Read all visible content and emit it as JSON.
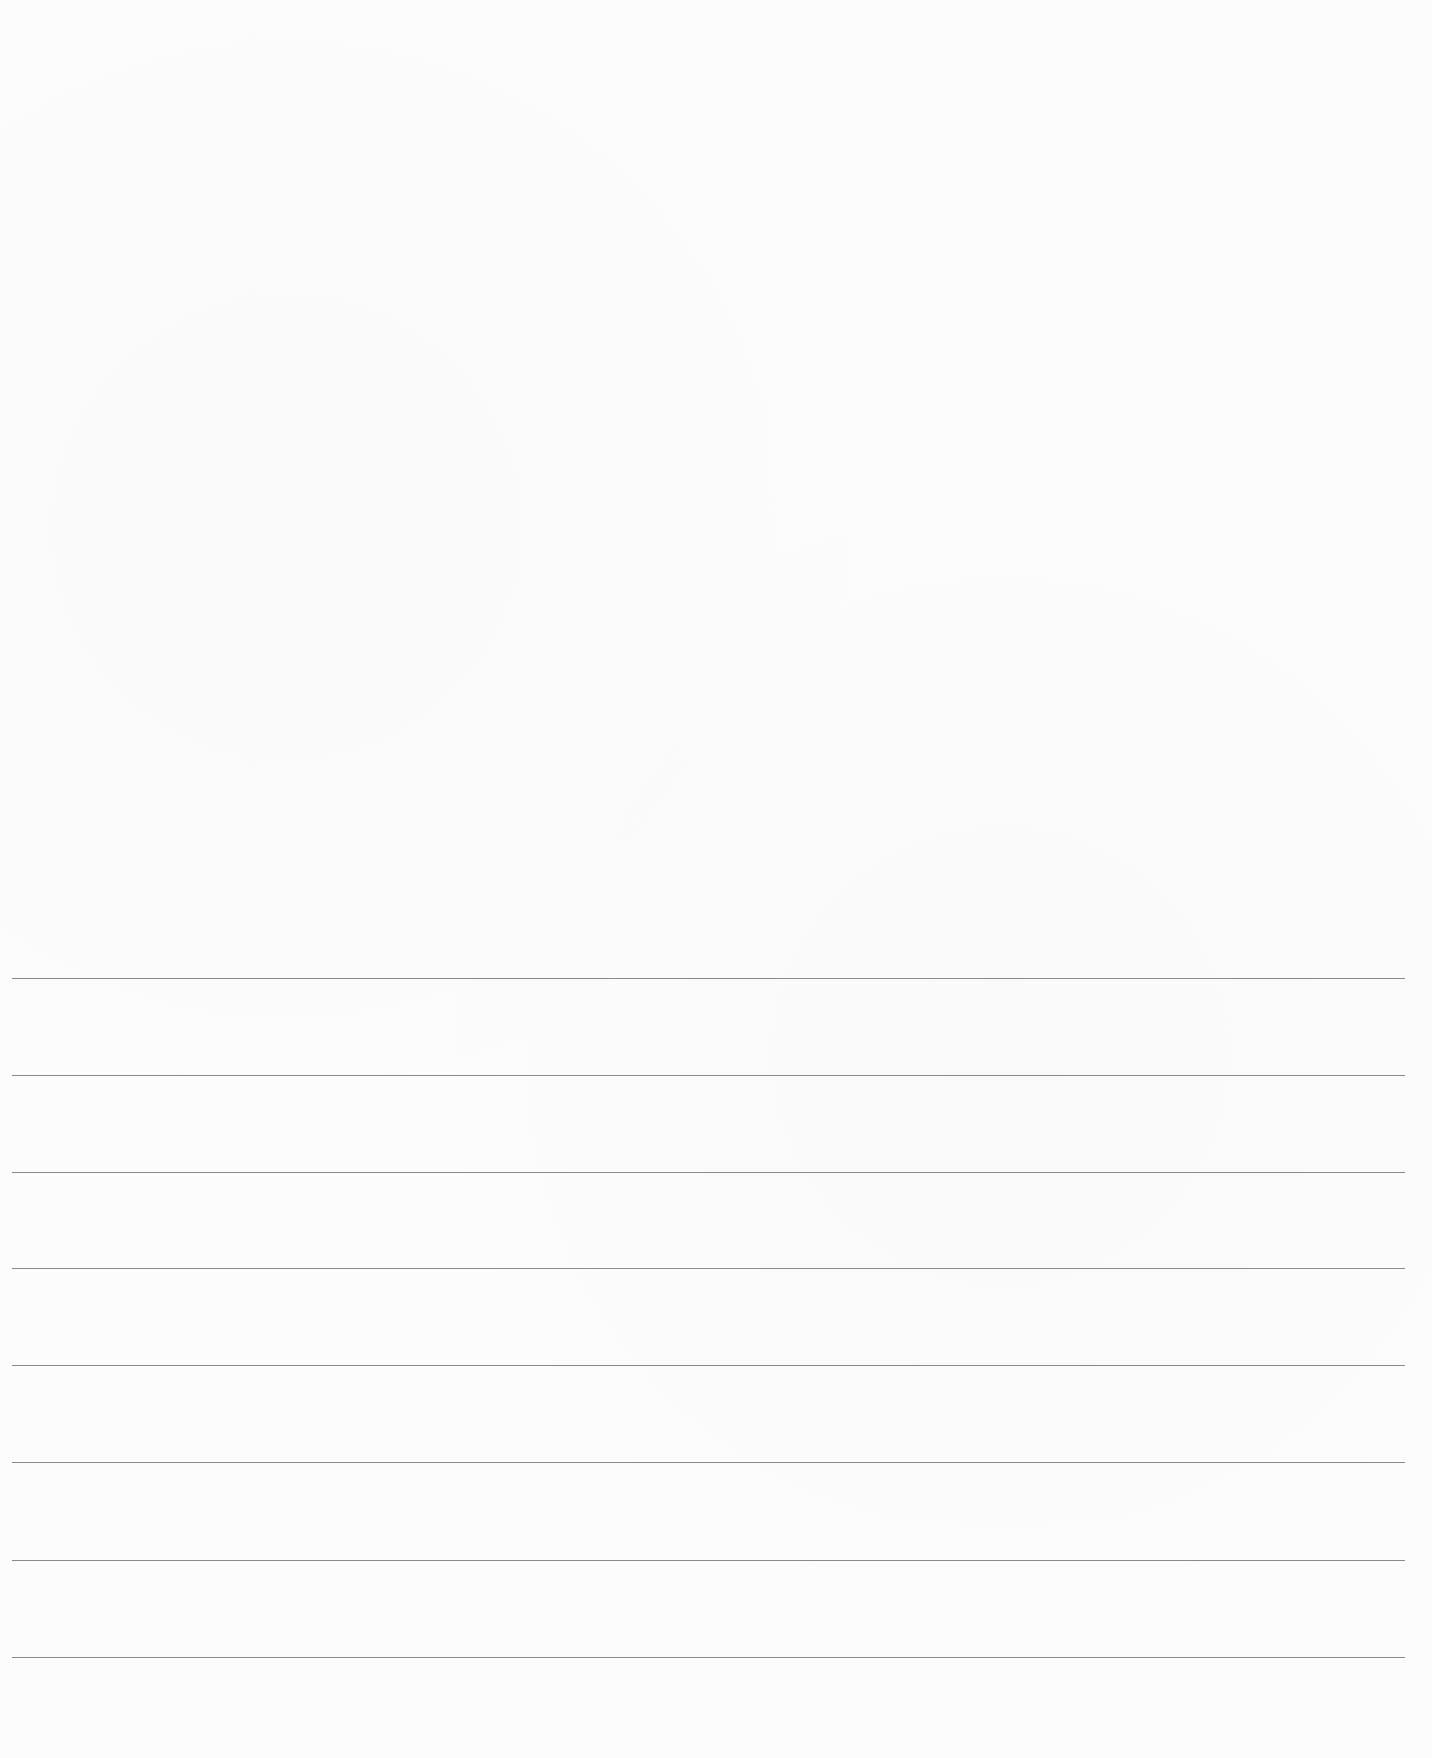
{
  "page": {
    "type": "lined-paper",
    "background_color": "#fcfcfc",
    "line_color": "#8a8a8a"
  },
  "ruled_lines": [
    {
      "y": 978
    },
    {
      "y": 1075
    },
    {
      "y": 1172
    },
    {
      "y": 1268
    },
    {
      "y": 1365
    },
    {
      "y": 1462
    },
    {
      "y": 1560
    },
    {
      "y": 1657
    }
  ]
}
